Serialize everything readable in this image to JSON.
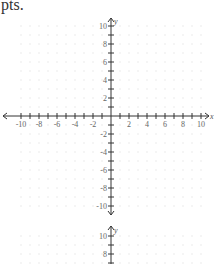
{
  "caption": "pts.",
  "graph1": {
    "x_axis_label": "x",
    "y_axis_label": "y",
    "x_ticks": [
      "-10",
      "-8",
      "-6",
      "-4",
      "-2",
      "2",
      "4",
      "6",
      "8",
      "10"
    ],
    "y_ticks": [
      "10",
      "8",
      "6",
      "4",
      "2",
      "-2",
      "-4",
      "-6",
      "-8",
      "-10"
    ]
  },
  "graph2": {
    "y_axis_label": "y",
    "y_ticks": [
      "10",
      "8"
    ]
  },
  "colors": {
    "axis": "#333333",
    "grid_dot": "#d8d8d8",
    "tick_label": "#666666"
  },
  "chart_data": {
    "type": "scatter",
    "title": "",
    "xlabel": "x",
    "ylabel": "y",
    "xlim": [
      -10,
      10
    ],
    "ylim": [
      -10,
      10
    ],
    "x_tick_labels": [
      "-10",
      "-8",
      "-6",
      "-4",
      "-2",
      "2",
      "4",
      "6",
      "8",
      "10"
    ],
    "y_tick_labels": [
      "10",
      "8",
      "6",
      "4",
      "2",
      "-2",
      "-4",
      "-6",
      "-8",
      "-10"
    ],
    "grid": "dotted",
    "series": []
  }
}
